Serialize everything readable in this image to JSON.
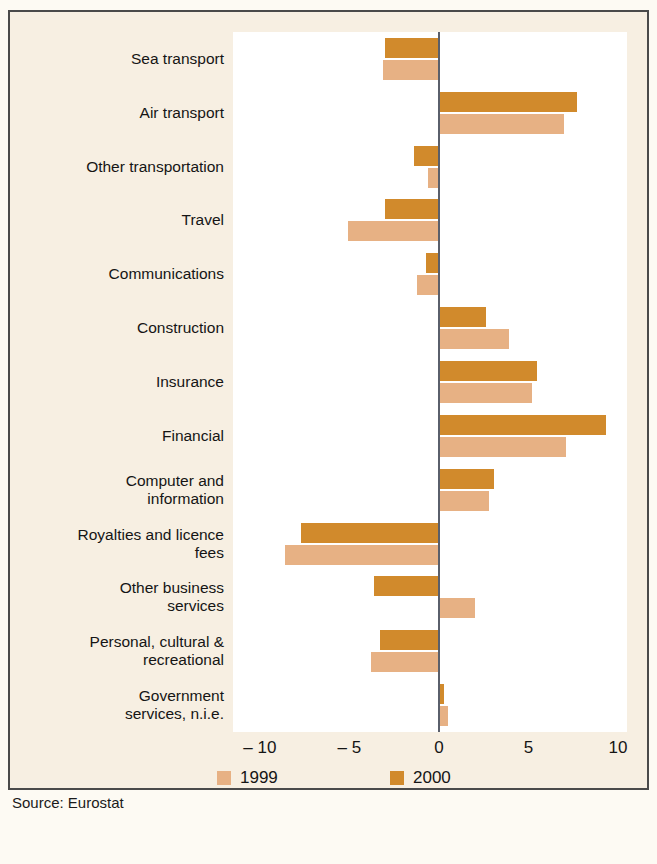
{
  "chart_data": {
    "type": "bar",
    "orientation": "horizontal",
    "title": "",
    "subtitle": "",
    "xlabel": "",
    "ylabel": "",
    "xlim": [
      -11.5,
      10.5
    ],
    "xticks": [
      -10,
      -5,
      0,
      5,
      10
    ],
    "xticklabels": [
      "– 10",
      "– 5",
      "0",
      "5",
      "10"
    ],
    "grid": false,
    "zero_line": true,
    "legend_position": "bottom",
    "categories": [
      "Sea transport",
      "Air transport",
      "Other transportation",
      "Travel",
      "Communications",
      "Construction",
      "Insurance",
      "Financial",
      "Computer and information",
      "Royalties and licence fees",
      "Other business services",
      "Personal, cultural & recreational",
      "Government services, n.i.e."
    ],
    "series": [
      {
        "name": "1999",
        "color": "#e7b184",
        "values": [
          -3.1,
          7.0,
          -0.6,
          -5.1,
          -1.2,
          3.9,
          5.2,
          7.1,
          2.8,
          -8.6,
          2.0,
          -3.8,
          0.5
        ]
      },
      {
        "name": "2000",
        "color": "#d18a2c",
        "values": [
          -3.0,
          7.7,
          -1.4,
          -3.0,
          -0.7,
          2.6,
          5.5,
          9.3,
          3.1,
          -7.7,
          -3.6,
          -3.3,
          0.3
        ]
      }
    ]
  },
  "labels": {
    "category_lines": [
      [
        "Sea transport"
      ],
      [
        "Air transport"
      ],
      [
        "Other transportation"
      ],
      [
        "Travel"
      ],
      [
        "Communications"
      ],
      [
        "Construction"
      ],
      [
        "Insurance"
      ],
      [
        "Financial"
      ],
      [
        "Computer and",
        "information"
      ],
      [
        "Royalties and licence",
        "fees"
      ],
      [
        "Other business",
        "services"
      ],
      [
        "Personal, cultural &",
        "recreational"
      ],
      [
        "Government",
        "services, n.i.e."
      ]
    ]
  },
  "legend": [
    {
      "label": "1999",
      "color": "#e7b184"
    },
    {
      "label": "2000",
      "color": "#d18a2c"
    }
  ],
  "source": "Source: Eurostat",
  "colors": {
    "panel_bg": "#f7efe2",
    "plot_bg": "#ffffff",
    "border": "#4a4a4a",
    "axis_line": "#5a5f6b",
    "text": "#151515",
    "series_1999": "#e7b184",
    "series_2000": "#d18a2c"
  }
}
